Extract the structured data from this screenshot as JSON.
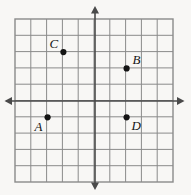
{
  "figure": {
    "type": "coordinate-grid",
    "background_color": "#f8f7f5",
    "grid_line_color": "#8a8a8a",
    "axis_color": "#4a4a4a",
    "point_color": "#141414",
    "label_color": "#141414"
  },
  "chart_data": {
    "type": "scatter",
    "title": "",
    "xlabel": "",
    "ylabel": "",
    "grid": true,
    "legend": false,
    "xlim": [
      -6,
      4
    ],
    "ylim": [
      -6,
      4
    ],
    "x_tick_step": 1,
    "y_tick_step": 1,
    "tick_labels_shown": false,
    "axes": {
      "x_axis_visible": true,
      "y_axis_visible": true,
      "x_axis_arrows": [
        "left",
        "right"
      ],
      "y_axis_arrows": [
        "up",
        "down"
      ]
    },
    "points": [
      {
        "label": "A",
        "x": -3,
        "y": -1,
        "label_position": "below-left"
      },
      {
        "label": "B",
        "x": 2,
        "y": 2,
        "label_position": "above-right"
      },
      {
        "label": "C",
        "x": -2,
        "y": 3,
        "label_position": "above-left"
      },
      {
        "label": "D",
        "x": 2,
        "y": -1,
        "label_position": "below-right"
      }
    ]
  },
  "geometry": {
    "grid_left_px": 15,
    "grid_top_px": 19,
    "cell_width_px": 15.8,
    "cell_height_px": 16.3,
    "cols": 10,
    "rows": 10,
    "origin_x_px": 95,
    "origin_y_px": 101
  },
  "labels": {
    "a": "A",
    "b": "B",
    "c": "C",
    "d": "D"
  }
}
